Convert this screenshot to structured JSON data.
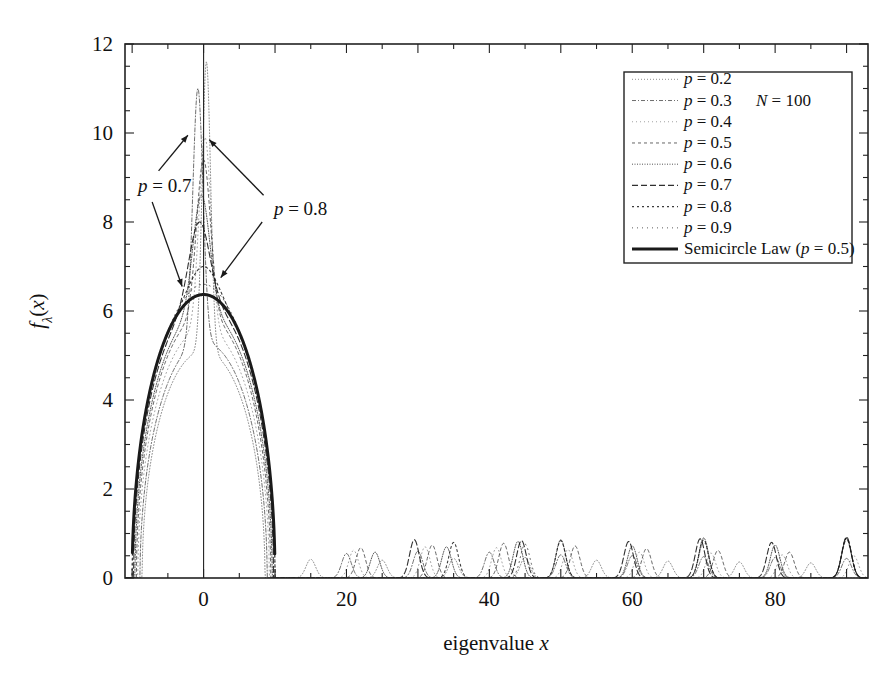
{
  "chart_data": {
    "type": "line",
    "title": "",
    "xlabel": "eigenvalue x",
    "ylabel": "fλ(x)",
    "xlim": [
      -11,
      93
    ],
    "ylim": [
      0,
      12
    ],
    "xticks": [
      0,
      20,
      40,
      60,
      80
    ],
    "xticklabels": [
      "0",
      "20",
      "40",
      "60",
      "80"
    ],
    "yticks": [
      0,
      2,
      4,
      6,
      8,
      10,
      12
    ],
    "yticklabels": [
      "0",
      "2",
      "4",
      "6",
      "8",
      "10",
      "12"
    ],
    "x_minor_tick_step": 5,
    "y_minor_tick_step": 0.5,
    "grid": false,
    "legend_position": "upper right",
    "annotations": [
      {
        "text": "p = 0.7",
        "x": -7.5,
        "y": 8.8
      },
      {
        "text": "p = 0.8",
        "x": 9.0,
        "y": 8.3
      },
      {
        "text": "N = 100",
        "x": 54.0,
        "y": 11.0
      }
    ],
    "series": [
      {
        "name": "p = 0.2",
        "dash": "dotted-fine",
        "peak_x": 0.4,
        "peak_y": 11.6,
        "half_width": 0.9,
        "bulk_halfwidth": 8.6,
        "bulk_peak": 5.1,
        "outlier_peaks": [
          {
            "x": 15,
            "y": 0.42
          },
          {
            "x": 25,
            "y": 0.4
          },
          {
            "x": 35,
            "y": 0.44
          },
          {
            "x": 45,
            "y": 0.46
          },
          {
            "x": 55,
            "y": 0.4
          },
          {
            "x": 65,
            "y": 0.38
          },
          {
            "x": 75,
            "y": 0.36
          },
          {
            "x": 85,
            "y": 0.34
          }
        ]
      },
      {
        "name": "p = 0.3",
        "dash": "dash-dot-fine",
        "peak_x": -0.8,
        "peak_y": 11.0,
        "half_width": 1.1,
        "bulk_halfwidth": 8.9,
        "bulk_peak": 5.3,
        "outlier_peaks": [
          {
            "x": 20,
            "y": 0.55
          },
          {
            "x": 30,
            "y": 0.6
          },
          {
            "x": 40,
            "y": 0.58
          },
          {
            "x": 50,
            "y": 0.52
          },
          {
            "x": 60,
            "y": 0.5
          },
          {
            "x": 70,
            "y": 0.48
          },
          {
            "x": 80,
            "y": 0.46
          },
          {
            "x": 90,
            "y": 0.44
          }
        ]
      },
      {
        "name": "p = 0.4",
        "dash": "dotted-light",
        "peak_x": 0.2,
        "peak_y": 9.9,
        "half_width": 1.3,
        "bulk_halfwidth": 9.2,
        "bulk_peak": 5.6,
        "outlier_peaks": [
          {
            "x": 21,
            "y": 0.62
          },
          {
            "x": 31,
            "y": 0.7
          },
          {
            "x": 41,
            "y": 0.68
          },
          {
            "x": 51,
            "y": 0.64
          },
          {
            "x": 61,
            "y": 0.58
          },
          {
            "x": 71,
            "y": 0.56
          },
          {
            "x": 81,
            "y": 0.52
          },
          {
            "x": 91,
            "y": 0.5
          }
        ]
      },
      {
        "name": "p = 0.5",
        "dash": "dashed-short",
        "peak_x": 0.0,
        "peak_y": 9.4,
        "half_width": 1.5,
        "bulk_halfwidth": 9.4,
        "bulk_peak": 5.9,
        "outlier_peaks": [
          {
            "x": 22,
            "y": 0.68
          },
          {
            "x": 32,
            "y": 0.74
          },
          {
            "x": 42,
            "y": 0.78
          },
          {
            "x": 52,
            "y": 0.72
          },
          {
            "x": 62,
            "y": 0.66
          },
          {
            "x": 72,
            "y": 0.62
          },
          {
            "x": 82,
            "y": 0.58
          },
          {
            "x": 90,
            "y": 0.9
          }
        ]
      },
      {
        "name": "p = 0.6",
        "dash": "dotted-dense",
        "peak_x": -0.3,
        "peak_y": 8.6,
        "half_width": 1.8,
        "bulk_halfwidth": 9.6,
        "bulk_peak": 6.0,
        "outlier_peaks": [
          {
            "x": 24,
            "y": 0.58
          },
          {
            "x": 34,
            "y": 0.7
          },
          {
            "x": 44,
            "y": 0.82
          },
          {
            "x": 50,
            "y": 0.86
          },
          {
            "x": 60,
            "y": 0.72
          },
          {
            "x": 70,
            "y": 0.9
          },
          {
            "x": 80,
            "y": 0.74
          },
          {
            "x": 90,
            "y": 0.88
          }
        ]
      },
      {
        "name": "p = 0.7",
        "dash": "dash-long",
        "peak_x": -0.6,
        "peak_y": 8.0,
        "half_width": 2.2,
        "bulk_halfwidth": 9.8,
        "bulk_peak": 6.2,
        "outlier_peaks": [
          {
            "x": 29.5,
            "y": 0.86
          },
          {
            "x": 44.5,
            "y": 0.84
          },
          {
            "x": 59.5,
            "y": 0.82
          },
          {
            "x": 69.5,
            "y": 0.88
          },
          {
            "x": 79.5,
            "y": 0.8
          },
          {
            "x": 90,
            "y": 0.92
          }
        ]
      },
      {
        "name": "p = 0.8",
        "dash": "dotted-wide",
        "peak_x": 0.0,
        "peak_y": 7.0,
        "half_width": 3.0,
        "bulk_halfwidth": 10.0,
        "bulk_peak": 6.3,
        "outlier_peaks": [
          {
            "x": 35,
            "y": 0.8
          },
          {
            "x": 50,
            "y": 0.84
          },
          {
            "x": 70,
            "y": 0.86
          },
          {
            "x": 90,
            "y": 0.9
          }
        ]
      },
      {
        "name": "p = 0.9",
        "dash": "dotted-vwide",
        "peak_x": 0.0,
        "peak_y": 6.6,
        "half_width": 4.5,
        "bulk_halfwidth": 10.0,
        "bulk_peak": 6.35,
        "outlier_peaks": [
          {
            "x": 45,
            "y": 0.76
          },
          {
            "x": 70,
            "y": 0.82
          },
          {
            "x": 90,
            "y": 0.86
          }
        ]
      },
      {
        "name": "Semicircle Law (p = 0.5)",
        "dash": "solid-thick",
        "peak_x": 0.0,
        "peak_y": 6.37,
        "half_width": 10.0,
        "bulk_halfwidth": 10.0,
        "bulk_peak": 6.37,
        "outlier_peaks": []
      }
    ]
  },
  "legend": {
    "entries": [
      {
        "label": "p = 0.2"
      },
      {
        "label": "p = 0.3"
      },
      {
        "label": "p = 0.4"
      },
      {
        "label": "p = 0.5"
      },
      {
        "label": "p = 0.6"
      },
      {
        "label": "p = 0.7"
      },
      {
        "label": "p = 0.8"
      },
      {
        "label": "p = 0.9"
      },
      {
        "label": "Semicircle Law (p = 0.5)"
      }
    ],
    "note": "N = 100"
  },
  "axes": {
    "x_title": "eigenvalue x",
    "y_title": "fλ(x)"
  },
  "colors": {
    "line": "#1a1a1a",
    "frame": "#222222",
    "background": "#ffffff",
    "faint": "#6e6e6e"
  }
}
